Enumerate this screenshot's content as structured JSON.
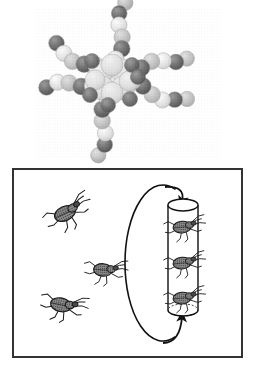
{
  "figure": {
    "caption": "",
    "background_color": "#ffffff",
    "width": 255,
    "height": 369
  },
  "molecule_panel": {
    "name": "space-filling-molecular-model",
    "description": "Star-shaped / dendritic space-filling molecular model with a central core cluster and six radiating arms of spheres",
    "render_style": "halftone-dithered-grayscale",
    "core": {
      "cx": 112,
      "cy": 79,
      "r": 25
    },
    "colors": {
      "light_sphere": "#e2e2e2",
      "mid_sphere": "#b8b8b8",
      "dark_sphere": "#545454",
      "outline": "#9a9a9a",
      "core_fill": "#d4d4d4"
    },
    "arms": [
      {
        "label": "arm-up",
        "angle_deg": -80,
        "atom_count": 6
      },
      {
        "label": "arm-upper-left",
        "angle_deg": -150,
        "atom_count": 5
      },
      {
        "label": "arm-left",
        "angle_deg": 172,
        "atom_count": 5
      },
      {
        "label": "arm-down",
        "angle_deg": 100,
        "atom_count": 6
      },
      {
        "label": "arm-right-upper",
        "angle_deg": -18,
        "atom_count": 6
      },
      {
        "label": "arm-right-lower",
        "angle_deg": 18,
        "atom_count": 6
      }
    ]
  },
  "cycle_panel": {
    "name": "insect-circulation-diagram",
    "frame": {
      "x": 13,
      "y": 4,
      "width": 229,
      "height": 188,
      "stroke": "#333333",
      "stroke_width": 2
    },
    "loop": {
      "name": "circulation-loop",
      "cx": 147,
      "cy": 98,
      "rx": 38,
      "ry": 78,
      "stroke": "#111111",
      "stroke_width": 1.6,
      "direction": "clockwise"
    },
    "arrows": [
      {
        "name": "arrow-into-cylinder-top",
        "direction": "down",
        "x": 182,
        "y": 40
      },
      {
        "name": "arrow-into-cylinder-bottom",
        "direction": "up",
        "x": 182,
        "y": 148
      }
    ],
    "cylinder": {
      "name": "trap-cylinder",
      "x": 168,
      "y": 40,
      "width": 30,
      "height": 105,
      "stroke": "#111111",
      "fill": "#ffffff",
      "ellipse_ry": 6,
      "captured_insect_count": 3
    },
    "free_insects": [
      {
        "name": "free-insect-upper",
        "x": 66,
        "y": 48,
        "scale": 1.15,
        "rotate_deg": -25
      },
      {
        "name": "free-insect-middle",
        "x": 104,
        "y": 105,
        "scale": 1.0,
        "rotate_deg": 5
      },
      {
        "name": "free-insect-lower",
        "x": 62,
        "y": 140,
        "scale": 1.1,
        "rotate_deg": 12
      }
    ],
    "captured_insects": [
      {
        "name": "captured-insect-top",
        "x": 183,
        "y": 62,
        "scale": 0.95,
        "rotate_deg": -5
      },
      {
        "name": "captured-insect-middle",
        "x": 183,
        "y": 98,
        "scale": 0.95,
        "rotate_deg": -5
      },
      {
        "name": "captured-insect-bottom",
        "x": 183,
        "y": 133,
        "scale": 0.95,
        "rotate_deg": -5
      }
    ],
    "insect_colors": {
      "body_fill": "#7a7a7a",
      "body_outline": "#1a1a1a",
      "leg_stroke": "#1a1a1a"
    }
  }
}
